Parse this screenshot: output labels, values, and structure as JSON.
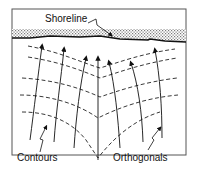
{
  "figure": {
    "type": "wave refraction diagram",
    "labels": {
      "shoreline": "Shoreline",
      "contours": "Contours",
      "orthogonals": "Orthogonals"
    },
    "elements": {
      "shoreline_band": "stippled land strip along top",
      "contour_lines": "dashed depth contours dipping toward center",
      "orthogonal_arrows": 7
    },
    "colors": {
      "line": "#111111",
      "stipple": "#8a8a8a",
      "frame": "#555555",
      "background": "#ffffff"
    }
  }
}
